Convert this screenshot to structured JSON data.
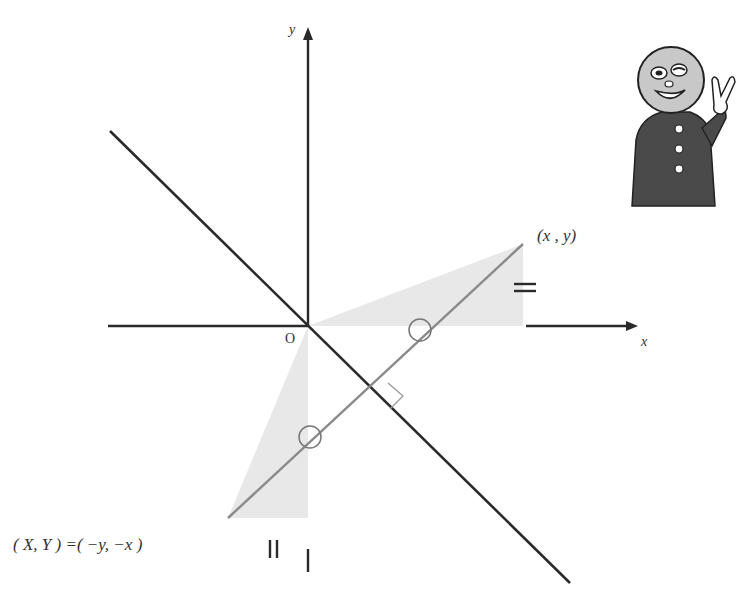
{
  "diagram": {
    "type": "coordinate-reflection",
    "axes": {
      "x_label": "x",
      "y_label": "y",
      "origin_label": "O"
    },
    "points": {
      "original": "(x , y)",
      "reflected": "( X, Y ) =( −y, −x )"
    },
    "marks": {
      "equal_horizontal": "=",
      "equal_vertical": "||",
      "single_tick": "|",
      "angle_circle_1": "○",
      "angle_circle_2": "○",
      "right_angle": "⊥"
    },
    "colors": {
      "axis": "#2a2a2a",
      "mirror_line": "#2a2a2a",
      "segment": "#8a8a8a",
      "shading": "#e6e6e6",
      "character_head": "#c8c8c8",
      "character_coat": "#4a4a4a"
    },
    "character": {
      "name": "mascot",
      "gesture": "peace-sign"
    }
  }
}
